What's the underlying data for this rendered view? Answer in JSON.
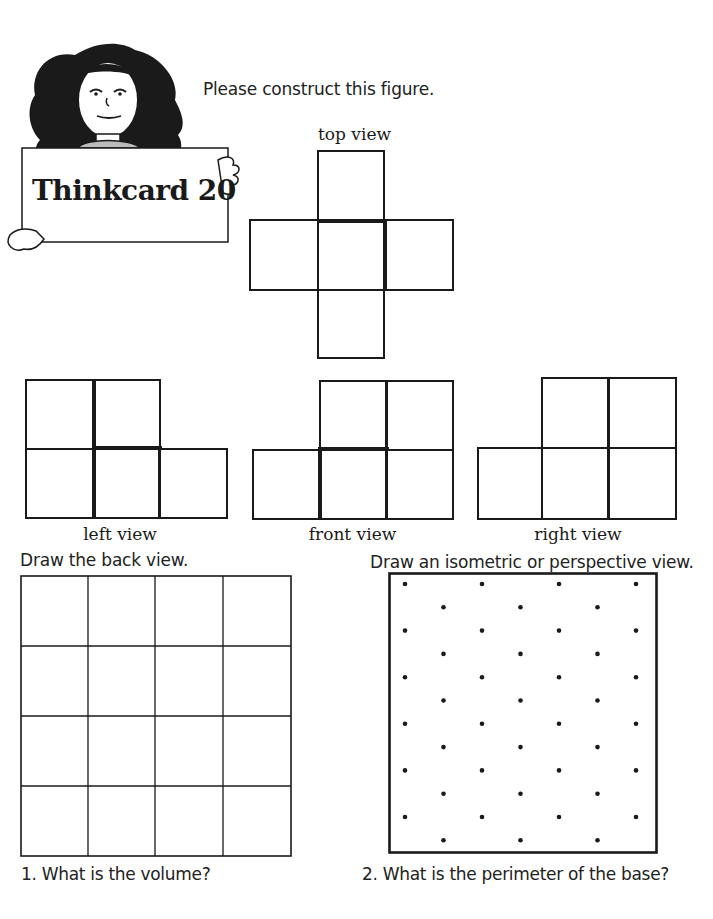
{
  "card": {
    "title": "Thinkcard 20"
  },
  "instructions": {
    "construct": "Please construct this figure.",
    "back_view": "Draw the back view.",
    "isometric": "Draw an isometric or perspective view."
  },
  "views": {
    "top": {
      "label": "top view"
    },
    "left": {
      "label": "left view"
    },
    "front": {
      "label": "front view"
    },
    "right": {
      "label": "right view"
    }
  },
  "back_view_grid": {
    "rows": 4,
    "cols": 4
  },
  "isometric_dot_grid": {
    "rows": 12,
    "cols_even_rows": 4,
    "cols_odd_rows": 3
  },
  "questions": [
    {
      "number": "1.",
      "text": "What is the volume?"
    },
    {
      "number": "2.",
      "text": "What is the perimeter of the base?"
    }
  ]
}
